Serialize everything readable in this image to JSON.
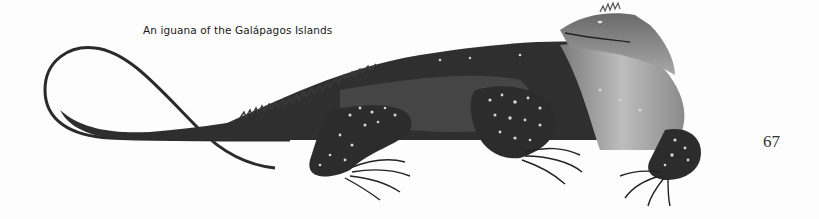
{
  "page": {
    "caption": "An iguana of the Galápagos Islands",
    "page_number": "67"
  },
  "illustration": {
    "subject": "iguana-illustration",
    "colors": {
      "body_dark": "#2e2e2e",
      "body_mid": "#5a5a5a",
      "throat_light": "#b8b8b8",
      "head_light": "#9a9a9a",
      "spots": "#d8d8d8"
    }
  }
}
